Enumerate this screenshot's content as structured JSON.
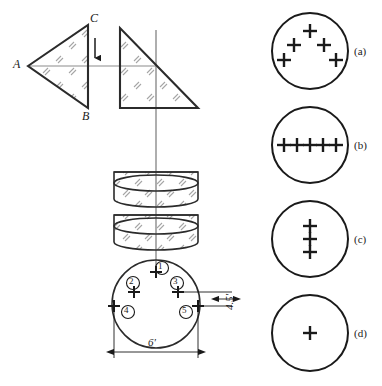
{
  "figure": {
    "colors": {
      "stroke": "#1a1a1a",
      "axis": "#8c8c8c",
      "hatch": "#9a9a9a",
      "background": "#ffffff"
    }
  },
  "object_triangle": {
    "name": "left-triangle",
    "vertices": [
      {
        "label": "A",
        "x": 28,
        "y": 66
      },
      {
        "label": "C",
        "x": 88,
        "y": 25
      },
      {
        "label": "B",
        "x": 88,
        "y": 108
      }
    ],
    "labels": {
      "a": "A",
      "b": "B",
      "c": "C"
    }
  },
  "image_triangle": {
    "name": "right-triangle",
    "description": "right triangle with vertical left edge and horizontal bottom edge"
  },
  "arrow": {
    "name": "direction-arrow",
    "direction": "down"
  },
  "lenses": [
    {
      "name": "lens-upper",
      "shape": "cylinder"
    },
    {
      "name": "lens-lower",
      "shape": "cylinder"
    }
  ],
  "aperture_circle": {
    "name": "aperture-circle",
    "markers": [
      {
        "id": "1",
        "badge": "①",
        "position": "top-center"
      },
      {
        "id": "2",
        "badge": "②",
        "position": "upper-left"
      },
      {
        "id": "3",
        "badge": "③",
        "position": "upper-right"
      },
      {
        "id": "4",
        "badge": "④",
        "position": "lower-left"
      },
      {
        "id": "5",
        "badge": "⑤",
        "position": "lower-right"
      }
    ],
    "dimensions": {
      "width_label": "6'",
      "height_label": "4.5'"
    }
  },
  "options": [
    {
      "key": "a",
      "label": "(a)",
      "name": "option-circle-a",
      "cross_count": 5,
      "arrangement": "scattered-ring",
      "crosses": [
        {
          "x": 0,
          "y": -20
        },
        {
          "x": -16,
          "y": -6
        },
        {
          "x": 14,
          "y": -6
        },
        {
          "x": -26,
          "y": 9
        },
        {
          "x": 26,
          "y": 9
        }
      ]
    },
    {
      "key": "b",
      "label": "(b)",
      "name": "option-circle-b",
      "cross_count": 5,
      "arrangement": "horizontal-row",
      "crosses": [
        {
          "x": -26,
          "y": 0
        },
        {
          "x": -13,
          "y": 0
        },
        {
          "x": 0,
          "y": 0
        },
        {
          "x": 13,
          "y": 0
        },
        {
          "x": 26,
          "y": 0
        }
      ]
    },
    {
      "key": "c",
      "label": "(c)",
      "name": "option-circle-c",
      "cross_count": 3,
      "arrangement": "vertical-column",
      "crosses": [
        {
          "x": 0,
          "y": -13
        },
        {
          "x": 0,
          "y": 0
        },
        {
          "x": 0,
          "y": 13
        }
      ]
    },
    {
      "key": "d",
      "label": "(d)",
      "name": "option-circle-d",
      "cross_count": 1,
      "arrangement": "single-center",
      "crosses": [
        {
          "x": 0,
          "y": 0
        }
      ]
    }
  ]
}
